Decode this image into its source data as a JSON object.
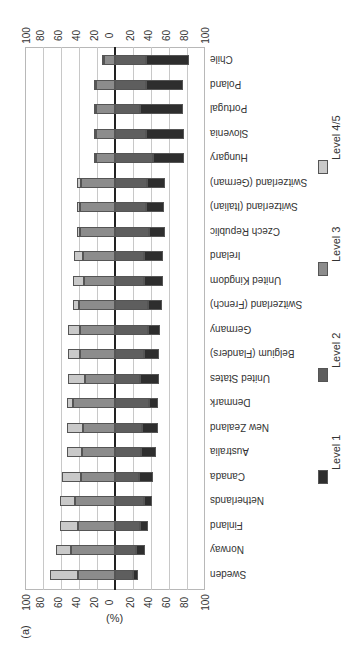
{
  "panel_label": "(a)",
  "unit_label": "(%)",
  "colors": {
    "level1": "#2e2e2e",
    "level2": "#5e5e5e",
    "level3": "#8c8c8c",
    "level45": "#c9c9c9"
  },
  "legend": [
    {
      "key": "level1",
      "label": "Level 1"
    },
    {
      "key": "level2",
      "label": "Level 2"
    },
    {
      "key": "level3",
      "label": "Level 3"
    },
    {
      "key": "level45",
      "label": "Level 4/5"
    }
  ],
  "axis_ticks_top": [
    "100",
    "80",
    "60",
    "40",
    "20",
    "0",
    "20",
    "40",
    "60",
    "80",
    "100"
  ],
  "axis_ticks_bottom": [
    "100",
    "80",
    "60",
    "40",
    "20",
    "0",
    "20",
    "40",
    "60",
    "80",
    "100"
  ],
  "chart_data": {
    "type": "bar",
    "orientation": "horizontal diverging stacked (image rotated 180°)",
    "title": "",
    "xlabel": "(%)",
    "ylabel": "",
    "xlim": [
      -100,
      100
    ],
    "grid": true,
    "legend_position": "right, vertical",
    "note": "Level 1 and Level 2 extend to one side of zero; Level 3 and Level 4/5 extend to the other side",
    "categories": [
      "Chile",
      "Poland",
      "Portugal",
      "Slovenia",
      "Hungary",
      "Switzerland (German)",
      "Switzerland (Italian)",
      "Czech Republic",
      "Ireland",
      "United Kingdom",
      "Switzerland (French)",
      "Germany",
      "Belgium (Flanders)",
      "United States",
      "Denmark",
      "New Zealand",
      "Australia",
      "Canada",
      "Netherlands",
      "Finland",
      "Norway",
      "Sweden"
    ],
    "series": [
      {
        "name": "Level 1",
        "values": [
          48,
          41,
          48,
          42,
          35,
          20,
          20,
          18,
          22,
          22,
          15,
          13,
          17,
          21,
          10,
          18,
          17,
          16,
          9,
          9,
          10,
          6
        ]
      },
      {
        "name": "Level 2",
        "values": [
          35,
          35,
          28,
          35,
          42,
          36,
          35,
          38,
          32,
          32,
          37,
          37,
          32,
          28,
          38,
          30,
          29,
          27,
          32,
          28,
          24,
          20
        ]
      },
      {
        "name": "Level 3",
        "values": [
          12,
          21,
          21,
          21,
          21,
          38,
          39,
          39,
          36,
          35,
          40,
          39,
          39,
          33,
          47,
          36,
          37,
          38,
          45,
          41,
          49,
          41
        ]
      },
      {
        "name": "Level 4/5",
        "values": [
          3,
          3,
          3,
          3,
          3,
          5,
          4,
          4,
          10,
          12,
          7,
          13,
          14,
          20,
          7,
          18,
          17,
          21,
          16,
          21,
          17,
          32
        ]
      }
    ]
  }
}
